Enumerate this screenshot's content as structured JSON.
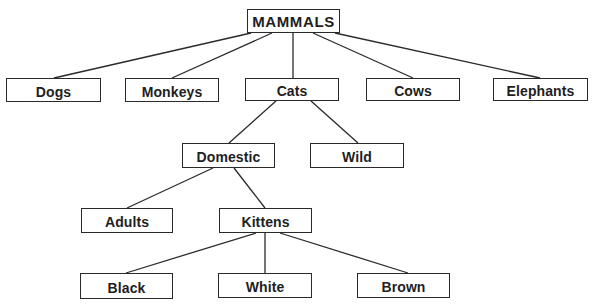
{
  "diagram": {
    "type": "hierarchy-tree",
    "colors": {
      "line": "#2a2a2a",
      "text": "#1e1e1e",
      "box_fill": "#ffffff",
      "background": "#ffffff"
    },
    "root": {
      "id": "mammals",
      "label": "MAMMALS",
      "box": [
        247,
        9,
        93,
        24
      ]
    },
    "level1": [
      {
        "id": "dogs",
        "label": "Dogs",
        "parent": "mammals",
        "box": [
          6,
          78,
          95,
          24
        ]
      },
      {
        "id": "monkeys",
        "label": "Monkeys",
        "parent": "mammals",
        "box": [
          125,
          78,
          94,
          24
        ]
      },
      {
        "id": "cats",
        "label": "Cats",
        "parent": "mammals",
        "box": [
          245,
          78,
          94,
          23
        ]
      },
      {
        "id": "cows",
        "label": "Cows",
        "parent": "mammals",
        "box": [
          366,
          78,
          94,
          23
        ]
      },
      {
        "id": "elephants",
        "label": "Elephants",
        "parent": "mammals",
        "box": [
          493,
          78,
          95,
          23
        ]
      }
    ],
    "level2": [
      {
        "id": "domestic",
        "label": "Domestic",
        "parent": "cats",
        "box": [
          182,
          143,
          93,
          25
        ]
      },
      {
        "id": "wild",
        "label": "Wild",
        "parent": "cats",
        "box": [
          310,
          143,
          94,
          25
        ]
      }
    ],
    "level3": [
      {
        "id": "adults",
        "label": "Adults",
        "parent": "domestic",
        "box": [
          81,
          208,
          92,
          25
        ]
      },
      {
        "id": "kittens",
        "label": "Kittens",
        "parent": "domestic",
        "box": [
          219,
          208,
          93,
          25
        ]
      }
    ],
    "level4": [
      {
        "id": "black",
        "label": "Black",
        "parent": "kittens",
        "box": [
          80,
          273,
          93,
          26
        ]
      },
      {
        "id": "white",
        "label": "White",
        "parent": "kittens",
        "box": [
          218,
          273,
          94,
          25
        ]
      },
      {
        "id": "brown",
        "label": "Brown",
        "parent": "kittens",
        "box": [
          357,
          273,
          93,
          25
        ]
      }
    ],
    "edges": [
      {
        "from": "mammals",
        "to": "dogs",
        "x1": 251,
        "y1": 33,
        "x2": 54,
        "y2": 78
      },
      {
        "from": "mammals",
        "to": "monkeys",
        "x1": 272,
        "y1": 33,
        "x2": 172,
        "y2": 78
      },
      {
        "from": "mammals",
        "to": "cats",
        "x1": 293,
        "y1": 33,
        "x2": 293,
        "y2": 78
      },
      {
        "from": "mammals",
        "to": "cows",
        "x1": 313,
        "y1": 33,
        "x2": 413,
        "y2": 78
      },
      {
        "from": "mammals",
        "to": "elephants",
        "x1": 335,
        "y1": 33,
        "x2": 540,
        "y2": 78
      },
      {
        "from": "cats",
        "to": "domestic",
        "x1": 276,
        "y1": 101,
        "x2": 229,
        "y2": 143
      },
      {
        "from": "cats",
        "to": "wild",
        "x1": 311,
        "y1": 101,
        "x2": 358,
        "y2": 143
      },
      {
        "from": "domestic",
        "to": "adults",
        "x1": 213,
        "y1": 168,
        "x2": 127,
        "y2": 208
      },
      {
        "from": "domestic",
        "to": "kittens",
        "x1": 234,
        "y1": 168,
        "x2": 265,
        "y2": 208
      },
      {
        "from": "kittens",
        "to": "black",
        "x1": 256,
        "y1": 233,
        "x2": 126,
        "y2": 273
      },
      {
        "from": "kittens",
        "to": "white",
        "x1": 265,
        "y1": 233,
        "x2": 265,
        "y2": 273
      },
      {
        "from": "kittens",
        "to": "brown",
        "x1": 280,
        "y1": 233,
        "x2": 408,
        "y2": 273
      }
    ]
  }
}
